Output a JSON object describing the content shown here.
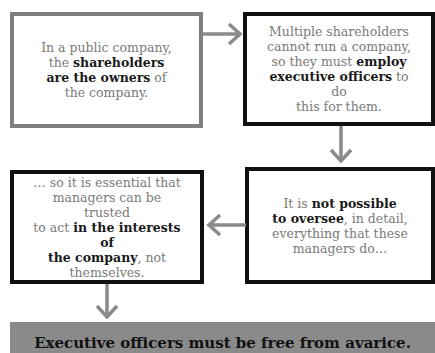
{
  "diagram": {
    "boxes": [
      {
        "id": "b1",
        "style": "grey",
        "parts": [
          {
            "t": "In a public company, the "
          },
          {
            "t": "shareholders are the owners",
            "b": true
          },
          {
            "t": " of the company."
          }
        ]
      },
      {
        "id": "b2",
        "style": "black",
        "parts": [
          {
            "t": "Multiple shareholders cannot run a company, so they must "
          },
          {
            "t": "employ executive officers",
            "b": true
          },
          {
            "t": " to do this for them."
          }
        ]
      },
      {
        "id": "b4",
        "style": "black",
        "parts": [
          {
            "t": "It is "
          },
          {
            "t": "not possible to oversee",
            "b": true
          },
          {
            "t": ", in detail, everything that these managers do…"
          }
        ]
      },
      {
        "id": "b3",
        "style": "black",
        "parts": [
          {
            "t": "… so it is essential that managers can be trusted to act "
          },
          {
            "t": "in the interests of the company",
            "b": true
          },
          {
            "t": ", not themselves."
          }
        ]
      }
    ],
    "arrows": [
      {
        "from": "b1",
        "to": "b2",
        "direction": "right"
      },
      {
        "from": "b2",
        "to": "b4",
        "direction": "down"
      },
      {
        "from": "b4",
        "to": "b3",
        "direction": "left"
      },
      {
        "from": "b3",
        "to": "banner",
        "direction": "down"
      }
    ],
    "banner": {
      "text": "Executive officers must be free from avarice."
    },
    "colors": {
      "arrow": "#8a8a8a",
      "banner_bg": "#8a8a8a",
      "grey_border": "#7f7f7f",
      "black_border": "#111111"
    }
  }
}
